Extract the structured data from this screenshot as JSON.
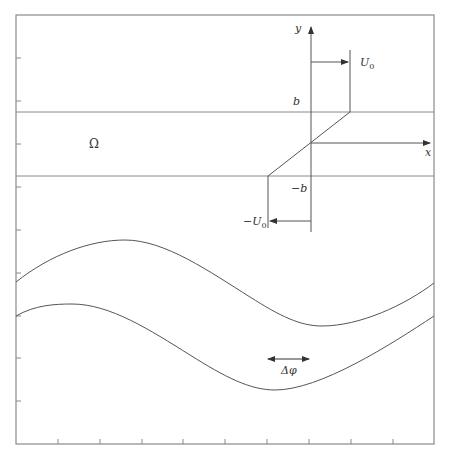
{
  "figure": {
    "colors": {
      "frame": "#8a8a8a",
      "line": "#555555",
      "text": "#333333"
    },
    "labels": {
      "y_axis": "y",
      "x_axis": "x",
      "b": "b",
      "minus_b": "−b",
      "u0": "U",
      "u0_sub": "0",
      "minus_u0": "−U",
      "minus_u0_sub": "0",
      "omega": "Ω",
      "delta_phi": "Δφ"
    },
    "frame": {
      "x": 16,
      "y": 15,
      "width": 418,
      "height": 429
    },
    "ticks": {
      "bottom_count": 9,
      "left_count": 9
    },
    "shear_layer": {
      "upper_boundary_y": 112,
      "lower_boundary_y": 176,
      "profile": "linear velocity profile from −U0 at y=−b to U0 at y=b"
    },
    "curves": [
      {
        "name": "upper-wave",
        "description": "sinusoidal streamline, peak near x=125, trough near x=320"
      },
      {
        "name": "lower-wave",
        "description": "sinusoidal streamline, peak near x=70, trough near x=273 (phase-shifted)"
      }
    ]
  }
}
